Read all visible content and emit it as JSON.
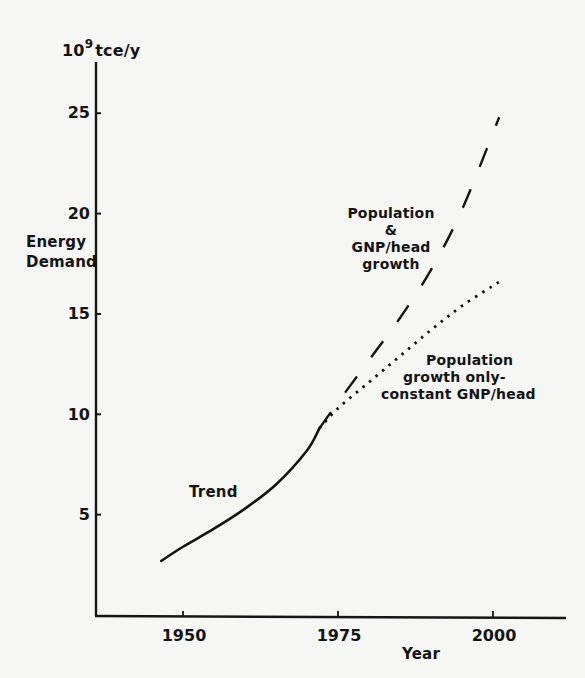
{
  "chart_data": {
    "type": "line",
    "title": "",
    "xlabel": "Year",
    "ylabel": "Energy Demand",
    "y_unit": "10^9 tce/y",
    "y_unit_base": "10",
    "y_unit_exp": "9",
    "y_unit_rest": "tce/y",
    "xlim": [
      1936,
      2011
    ],
    "ylim": [
      0,
      27.5
    ],
    "x_ticks": [
      1950,
      1975,
      2000
    ],
    "y_ticks": [
      5,
      10,
      15,
      20,
      25
    ],
    "grid": false,
    "legend": "inline annotations",
    "series": [
      {
        "name": "Trend",
        "style": "solid",
        "x": [
          1946.5,
          1950,
          1955,
          1960,
          1965,
          1970,
          1972
        ],
        "values": [
          2.7,
          3.4,
          4.3,
          5.3,
          6.5,
          8.2,
          9.3
        ]
      },
      {
        "name": "Population & GNP/head growth",
        "style": "dashed",
        "x": [
          1972,
          1975,
          1980,
          1985,
          1990,
          1995,
          2001
        ],
        "values": [
          9.3,
          10.6,
          12.7,
          14.8,
          17.2,
          20.2,
          24.8
        ]
      },
      {
        "name": "Population growth only - constant GNP/head",
        "style": "dotted",
        "x": [
          1972,
          1975,
          1980,
          1985,
          1990,
          1995,
          2001
        ],
        "values": [
          9.3,
          10.3,
          11.6,
          12.9,
          14.2,
          15.4,
          16.6
        ]
      }
    ],
    "annotations": {
      "trend": "Trend",
      "pop_gnp": [
        "Population",
        "&",
        "GNP/head",
        "growth"
      ],
      "pop_only": [
        "Population",
        "growth only-",
        "constant GNP/head"
      ]
    }
  }
}
